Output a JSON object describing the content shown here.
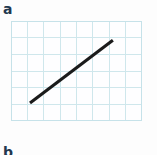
{
  "figure": {
    "panel_label": "a",
    "next_panel_label": "b",
    "background_color": "#fdfdfd",
    "label_color": "#22384f"
  },
  "chart_data": {
    "type": "line",
    "title": "",
    "subtitle": "",
    "xlabel": "",
    "ylabel": "",
    "grid": true,
    "grid_color": "#cfe7ec",
    "grid_columns": 8,
    "grid_rows": 6,
    "cell_width_px": 16.4,
    "cell_height_px": 16.7,
    "xlim": [
      0,
      8
    ],
    "ylim": [
      0,
      6
    ],
    "xticks": [
      0,
      1,
      2,
      3,
      4,
      5,
      6,
      7,
      8
    ],
    "yticks": [
      0,
      1,
      2,
      3,
      4,
      5,
      6
    ],
    "xtick_labels": [
      "",
      "",
      "",
      "",
      "",
      "",
      "",
      "",
      ""
    ],
    "ytick_labels": [
      "",
      "",
      "",
      "",
      "",
      "",
      ""
    ],
    "legend": [],
    "legend_position": "none",
    "annotations": [],
    "series": [
      {
        "name": "straight-line-graph",
        "color": "#1b1b1b",
        "line_width_px": 3.1,
        "x": [
          1.16,
          6.22
        ],
        "y": [
          1.08,
          4.85
        ],
        "points_px": [
          {
            "x": 19,
            "y": 82
          },
          {
            "x": 102,
            "y": 19
          }
        ]
      }
    ]
  }
}
